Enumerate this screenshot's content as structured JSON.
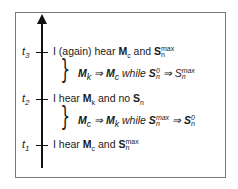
{
  "diagram": {
    "type": "timeline",
    "axis": {
      "direction": "up",
      "arrow": true
    },
    "events": [
      {
        "time": "t",
        "index": "3",
        "text_pre": "I (again) hear ",
        "m": "M",
        "m_sub": "c",
        "mid": " and  ",
        "s": "S",
        "s_sub": "n",
        "s_sup": "max"
      },
      {
        "time": "t",
        "index": "2",
        "text_pre": "I hear ",
        "m": "M",
        "m_sub": "k",
        "mid": " and  no ",
        "s": "S",
        "s_sub": "n",
        "s_sup": ""
      },
      {
        "time": "t",
        "index": "1",
        "text_pre": "I hear ",
        "m": "M",
        "m_sub": "c",
        "mid": " and  ",
        "s": "S",
        "s_sub": "n",
        "s_sup": "max"
      }
    ],
    "transitions": [
      {
        "between": "t2-t3",
        "from_m": "M",
        "from_m_sub": "k",
        "arrow": "⇒",
        "to_m": "M",
        "to_m_sub": "c",
        "while": " while ",
        "from_s": "S",
        "from_s_sub": "n",
        "from_s_sup": "0",
        "to_s": "S",
        "to_s_sub": "n",
        "to_s_sup": "max"
      },
      {
        "between": "t1-t2",
        "from_m": "M",
        "from_m_sub": "c",
        "arrow": "⇒",
        "to_m": "M",
        "to_m_sub": "k",
        "while": " while ",
        "from_s": "S",
        "from_s_sub": "n",
        "from_s_sup": "max",
        "to_s": "S",
        "to_s_sub": "n",
        "to_s_sup": "0"
      }
    ]
  }
}
